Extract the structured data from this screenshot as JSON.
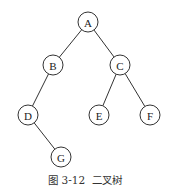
{
  "diagram": {
    "type": "binary-tree",
    "node_radius": 10,
    "nodes": [
      {
        "id": "A",
        "label": "A",
        "x": 88,
        "y": 22
      },
      {
        "id": "B",
        "label": "B",
        "x": 53,
        "y": 65
      },
      {
        "id": "C",
        "label": "C",
        "x": 120,
        "y": 65
      },
      {
        "id": "D",
        "label": "D",
        "x": 28,
        "y": 115
      },
      {
        "id": "E",
        "label": "E",
        "x": 99,
        "y": 115
      },
      {
        "id": "F",
        "label": "F",
        "x": 150,
        "y": 115
      },
      {
        "id": "G",
        "label": "G",
        "x": 61,
        "y": 157
      }
    ],
    "edges": [
      {
        "from": "A",
        "to": "B"
      },
      {
        "from": "A",
        "to": "C"
      },
      {
        "from": "B",
        "to": "D"
      },
      {
        "from": "C",
        "to": "E"
      },
      {
        "from": "C",
        "to": "F"
      },
      {
        "from": "D",
        "to": "G"
      }
    ]
  },
  "caption": "图 3-12  二叉树"
}
